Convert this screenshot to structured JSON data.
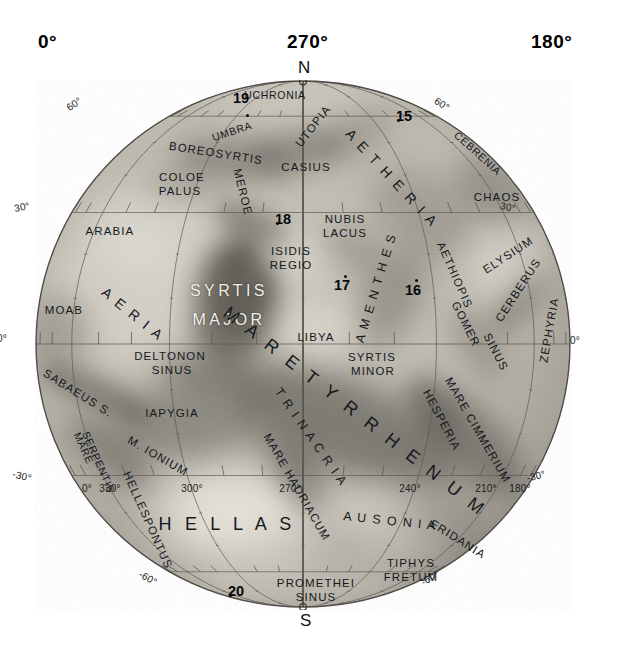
{
  "header_degrees": {
    "left": "0°",
    "middle": "270°",
    "right": "180°"
  },
  "poles": {
    "north": "N",
    "south": "S"
  },
  "globe": {
    "center_x": 303,
    "center_y": 344,
    "radius_x": 268,
    "radius_y": 264,
    "disk_color": "#b9b5ab",
    "limb_color": "#5d5a54"
  },
  "graticule": {
    "parallels": [
      60,
      30,
      0,
      -30,
      -60
    ],
    "meridian_step_deg": 30,
    "tick_step_deg": 10
  },
  "latitude_labels": [
    {
      "text": "60°",
      "x": 74,
      "y": 104,
      "rot": -34
    },
    {
      "text": "60°",
      "x": 442,
      "y": 104,
      "rot": 33
    },
    {
      "text": "30°",
      "x": 22,
      "y": 207,
      "rot": -12
    },
    {
      "text": "30°",
      "x": 508,
      "y": 207,
      "rot": 12
    },
    {
      "text": "0°",
      "x": 2,
      "y": 338,
      "rot": 0
    },
    {
      "text": "0°",
      "x": 575,
      "y": 340,
      "rot": 0
    },
    {
      "text": "-30°",
      "x": 22,
      "y": 476,
      "rot": 14
    },
    {
      "text": "-30°",
      "x": 536,
      "y": 476,
      "rot": -14
    },
    {
      "text": "-60°",
      "x": 148,
      "y": 578,
      "rot": 30
    },
    {
      "text": "-60°",
      "x": 430,
      "y": 578,
      "rot": -30
    }
  ],
  "longitude_labels": [
    {
      "text": "0°",
      "x": 87,
      "y": 488
    },
    {
      "text": "330°",
      "x": 110,
      "y": 488
    },
    {
      "text": "300°",
      "x": 192,
      "y": 488
    },
    {
      "text": "270°",
      "x": 290,
      "y": 488
    },
    {
      "text": "240°",
      "x": 410,
      "y": 488
    },
    {
      "text": "210°",
      "x": 486,
      "y": 488
    },
    {
      "text": "180°",
      "x": 520,
      "y": 488
    }
  ],
  "numbered_points": [
    {
      "label": "19",
      "x": 241,
      "y": 98,
      "dot_x": 247,
      "dot_y": 115,
      "dot_side": "below"
    },
    {
      "label": "15",
      "x": 404,
      "y": 116,
      "dot_x": 398,
      "dot_y": 120,
      "dot_side": "left"
    },
    {
      "label": "18",
      "x": 283,
      "y": 219,
      "dot_x": 277,
      "dot_y": 223,
      "dot_side": "left"
    },
    {
      "label": "17",
      "x": 342,
      "y": 285,
      "dot_x": 345,
      "dot_y": 276,
      "dot_side": "above"
    },
    {
      "label": "16",
      "x": 413,
      "y": 290,
      "dot_x": 416,
      "dot_y": 280,
      "dot_side": "above"
    },
    {
      "label": "20",
      "x": 236,
      "y": 591,
      "dot_x": 230,
      "dot_y": 595,
      "dot_side": "left"
    }
  ],
  "feature_labels": [
    {
      "text": "UCHRONIA",
      "x": 275,
      "y": 95,
      "rot": 0,
      "size": "s10",
      "align": "c"
    },
    {
      "text": "UMBRA",
      "x": 232,
      "y": 131,
      "rot": -18,
      "size": "s10",
      "align": "c"
    },
    {
      "text": "UTOPIA",
      "x": 313,
      "y": 126,
      "rot": -52,
      "size": "s11",
      "align": "c"
    },
    {
      "text": "BOREOSYRTIS",
      "x": 216,
      "y": 153,
      "rot": 9,
      "size": "s11",
      "align": "c"
    },
    {
      "text": "CASIUS",
      "x": 306,
      "y": 167,
      "rot": 0,
      "size": "s11",
      "align": "c"
    },
    {
      "text": "A E T H E R I A",
      "x": 392,
      "y": 178,
      "rot": 47,
      "size": "s14",
      "align": "c"
    },
    {
      "text": "CEBRENIA",
      "x": 478,
      "y": 153,
      "rot": 42,
      "size": "s10",
      "align": "c"
    },
    {
      "text": "COLOE",
      "x": 182,
      "y": 177,
      "rot": 0,
      "size": "s11",
      "align": "c"
    },
    {
      "text": "PALUS",
      "x": 180,
      "y": 191,
      "rot": 0,
      "size": "s11",
      "align": "c"
    },
    {
      "text": "MEROE",
      "x": 243,
      "y": 192,
      "rot": 76,
      "size": "s11",
      "align": "c"
    },
    {
      "text": "CHAOS",
      "x": 497,
      "y": 197,
      "rot": 0,
      "size": "s11",
      "align": "c"
    },
    {
      "text": "ARABIA",
      "x": 110,
      "y": 231,
      "rot": 0,
      "size": "s11",
      "align": "c"
    },
    {
      "text": "NUBIS",
      "x": 345,
      "y": 219,
      "rot": 0,
      "size": "s11",
      "align": "c"
    },
    {
      "text": "LACUS",
      "x": 345,
      "y": 233,
      "rot": 0,
      "size": "s11",
      "align": "c"
    },
    {
      "text": "ISIDIS",
      "x": 291,
      "y": 251,
      "rot": 0,
      "size": "s11",
      "align": "c"
    },
    {
      "text": "REGIO",
      "x": 291,
      "y": 265,
      "rot": 0,
      "size": "s11",
      "align": "c"
    },
    {
      "text": "ELYSIUM",
      "x": 508,
      "y": 255,
      "rot": -33,
      "size": "s11",
      "align": "c"
    },
    {
      "text": "AETHIOPIS",
      "x": 455,
      "y": 275,
      "rot": 66,
      "size": "s11",
      "align": "c"
    },
    {
      "text": "CERBERUS",
      "x": 518,
      "y": 290,
      "rot": -57,
      "size": "s11",
      "align": "c"
    },
    {
      "text": "ZEPHYRIA",
      "x": 549,
      "y": 330,
      "rot": -80,
      "size": "s11",
      "align": "c"
    },
    {
      "text": "MOAB",
      "x": 64,
      "y": 310,
      "rot": 0,
      "size": "s11",
      "align": "c"
    },
    {
      "text": "A E R I A",
      "x": 133,
      "y": 314,
      "rot": 39,
      "size": "s14",
      "align": "c"
    },
    {
      "text": "SYRTIS",
      "x": 229,
      "y": 291,
      "rot": 0,
      "size": "s16",
      "align": "c",
      "style": "white"
    },
    {
      "text": "MAJOR",
      "x": 229,
      "y": 320,
      "rot": 0,
      "size": "s16",
      "align": "c",
      "style": "white"
    },
    {
      "text": "LIBYA",
      "x": 316,
      "y": 337,
      "rot": 0,
      "size": "s11",
      "align": "c"
    },
    {
      "text": "GOMER",
      "x": 466,
      "y": 324,
      "rot": 63,
      "size": "s11",
      "align": "c"
    },
    {
      "text": "SINUS",
      "x": 496,
      "y": 352,
      "rot": 63,
      "size": "s11",
      "align": "c"
    },
    {
      "text": "DELTONON",
      "x": 170,
      "y": 356,
      "rot": 0,
      "size": "s11",
      "align": "c"
    },
    {
      "text": "SINUS",
      "x": 172,
      "y": 370,
      "rot": 0,
      "size": "s11",
      "align": "c"
    },
    {
      "text": "SYRTIS",
      "x": 372,
      "y": 357,
      "rot": 0,
      "size": "s11",
      "align": "c"
    },
    {
      "text": "MINOR",
      "x": 373,
      "y": 371,
      "rot": 0,
      "size": "s11",
      "align": "c"
    },
    {
      "text": "A M E N T H E S",
      "x": 376,
      "y": 288,
      "rot": -73,
      "size": "s12",
      "align": "c"
    },
    {
      "text": "SABAEUS S.",
      "x": 78,
      "y": 393,
      "rot": 32,
      "size": "s11",
      "align": "c"
    },
    {
      "text": "IAPYGIA",
      "x": 172,
      "y": 413,
      "rot": 0,
      "size": "s11",
      "align": "c"
    },
    {
      "text": "M A R E  T Y R R H E N U M",
      "x": 355,
      "y": 412,
      "rot": 38,
      "size": "s18",
      "align": "c"
    },
    {
      "text": "T R I N A C R I A",
      "x": 311,
      "y": 437,
      "rot": 55,
      "size": "s12",
      "align": "c"
    },
    {
      "text": "HESPERIA",
      "x": 442,
      "y": 420,
      "rot": 62,
      "size": "s11",
      "align": "c"
    },
    {
      "text": "MARE CIMMERIUM",
      "x": 478,
      "y": 430,
      "rot": 60,
      "size": "s11",
      "align": "c"
    },
    {
      "text": "MARE",
      "x": 84,
      "y": 448,
      "rot": 66,
      "size": "s10",
      "align": "c"
    },
    {
      "text": "SERPENTIS",
      "x": 99,
      "y": 462,
      "rot": 66,
      "size": "s10",
      "align": "c"
    },
    {
      "text": "M. IONIUM",
      "x": 158,
      "y": 456,
      "rot": 30,
      "size": "s11",
      "align": "c"
    },
    {
      "text": "MARE HADRIACUM",
      "x": 297,
      "y": 487,
      "rot": 60,
      "size": "s11",
      "align": "c"
    },
    {
      "text": "HELLESPONTUS",
      "x": 148,
      "y": 520,
      "rot": 66,
      "size": "s11",
      "align": "c"
    },
    {
      "text": "H E L L A S",
      "x": 227,
      "y": 524,
      "rot": 0,
      "size": "s18",
      "align": "c"
    },
    {
      "text": "A U S O N I A",
      "x": 390,
      "y": 521,
      "rot": 6,
      "size": "s12",
      "align": "c"
    },
    {
      "text": "ERIDANIA",
      "x": 458,
      "y": 539,
      "rot": 32,
      "size": "s11",
      "align": "c"
    },
    {
      "text": "TIPHYS",
      "x": 411,
      "y": 563,
      "rot": 0,
      "size": "s11",
      "align": "c"
    },
    {
      "text": "FRETUM",
      "x": 411,
      "y": 577,
      "rot": 0,
      "size": "s11",
      "align": "c"
    },
    {
      "text": "PROMETHEI",
      "x": 316,
      "y": 583,
      "rot": 0,
      "size": "s11",
      "align": "c"
    },
    {
      "text": "SINUS",
      "x": 316,
      "y": 597,
      "rot": 0,
      "size": "s11",
      "align": "c"
    }
  ],
  "albedo_features": [
    {
      "name": "syrtis-major",
      "cx": 235,
      "cy": 300,
      "rx": 46,
      "ry": 66,
      "rot": 10,
      "opacity": 0.62,
      "blur": 11
    },
    {
      "name": "syrtis-major-core",
      "cx": 238,
      "cy": 292,
      "rx": 30,
      "ry": 44,
      "rot": 12,
      "opacity": 0.5,
      "blur": 8
    },
    {
      "name": "syrtis-neck",
      "cx": 252,
      "cy": 225,
      "rx": 42,
      "ry": 17,
      "rot": 25,
      "opacity": 0.45,
      "blur": 10
    },
    {
      "name": "mare-tyrrhenum",
      "cx": 345,
      "cy": 425,
      "rx": 122,
      "ry": 45,
      "rot": 24,
      "opacity": 0.56,
      "blur": 16
    },
    {
      "name": "mare-cimmerium",
      "cx": 470,
      "cy": 440,
      "rx": 76,
      "ry": 30,
      "rot": 48,
      "opacity": 0.5,
      "blur": 14
    },
    {
      "name": "hesperia-dark",
      "cx": 432,
      "cy": 412,
      "rx": 40,
      "ry": 22,
      "rot": 55,
      "opacity": 0.35,
      "blur": 12
    },
    {
      "name": "iapygia-dark",
      "cx": 190,
      "cy": 420,
      "rx": 78,
      "ry": 40,
      "rot": -8,
      "opacity": 0.42,
      "blur": 16
    },
    {
      "name": "sabaeus-sinus",
      "cx": 95,
      "cy": 392,
      "rx": 60,
      "ry": 17,
      "rot": 26,
      "opacity": 0.48,
      "blur": 10
    },
    {
      "name": "mare-serpentis",
      "cx": 110,
      "cy": 452,
      "rx": 52,
      "ry": 22,
      "rot": 40,
      "opacity": 0.42,
      "blur": 12
    },
    {
      "name": "deltonon-sinus",
      "cx": 205,
      "cy": 372,
      "rx": 46,
      "ry": 20,
      "rot": 8,
      "opacity": 0.4,
      "blur": 12
    },
    {
      "name": "boreosyrtis",
      "cx": 236,
      "cy": 160,
      "rx": 62,
      "ry": 22,
      "rot": 5,
      "opacity": 0.38,
      "blur": 12
    },
    {
      "name": "casius-umbra",
      "cx": 296,
      "cy": 150,
      "rx": 48,
      "ry": 19,
      "rot": -8,
      "opacity": 0.34,
      "blur": 12
    },
    {
      "name": "utopia-dusky",
      "cx": 350,
      "cy": 135,
      "rx": 46,
      "ry": 22,
      "rot": -30,
      "opacity": 0.26,
      "blur": 14
    },
    {
      "name": "aetheria-dusky",
      "cx": 420,
      "cy": 215,
      "rx": 58,
      "ry": 36,
      "rot": 40,
      "opacity": 0.26,
      "blur": 16
    },
    {
      "name": "cebrenia-chaos",
      "cx": 489,
      "cy": 192,
      "rx": 42,
      "ry": 30,
      "rot": 40,
      "opacity": 0.3,
      "blur": 14
    },
    {
      "name": "amenthes-dark",
      "cx": 388,
      "cy": 300,
      "rx": 56,
      "ry": 30,
      "rot": -60,
      "opacity": 0.34,
      "blur": 14
    },
    {
      "name": "nubis-lacus",
      "cx": 352,
      "cy": 250,
      "rx": 36,
      "ry": 22,
      "rot": 20,
      "opacity": 0.24,
      "blur": 12
    },
    {
      "name": "cerberus-dark",
      "cx": 516,
      "cy": 305,
      "rx": 40,
      "ry": 15,
      "rot": -50,
      "opacity": 0.36,
      "blur": 11
    },
    {
      "name": "gomer-sinus",
      "cx": 478,
      "cy": 345,
      "rx": 42,
      "ry": 18,
      "rot": 62,
      "opacity": 0.28,
      "blur": 12
    },
    {
      "name": "hellas-bright",
      "cx": 236,
      "cy": 520,
      "rx": 86,
      "ry": 52,
      "rot": 0,
      "opacity": 0.55,
      "blur": 20,
      "bright": true
    },
    {
      "name": "hellas-core-bright",
      "cx": 228,
      "cy": 512,
      "rx": 54,
      "ry": 32,
      "rot": 0,
      "opacity": 0.5,
      "blur": 14,
      "bright": true
    },
    {
      "name": "aeria-bright",
      "cx": 125,
      "cy": 290,
      "rx": 72,
      "ry": 74,
      "rot": 0,
      "opacity": 0.42,
      "blur": 20,
      "bright": true
    },
    {
      "name": "arabia-bright",
      "cx": 150,
      "cy": 225,
      "rx": 64,
      "ry": 44,
      "rot": 0,
      "opacity": 0.36,
      "blur": 18,
      "bright": true
    },
    {
      "name": "libya-bright",
      "cx": 322,
      "cy": 330,
      "rx": 48,
      "ry": 30,
      "rot": 0,
      "opacity": 0.42,
      "blur": 16,
      "bright": true
    },
    {
      "name": "isidis-bright",
      "cx": 296,
      "cy": 256,
      "rx": 40,
      "ry": 28,
      "rot": 0,
      "opacity": 0.34,
      "blur": 14,
      "bright": true
    },
    {
      "name": "elysium-bright",
      "cx": 505,
      "cy": 258,
      "rx": 44,
      "ry": 34,
      "rot": -30,
      "opacity": 0.4,
      "blur": 16,
      "bright": true
    },
    {
      "name": "ausonia-bright",
      "cx": 392,
      "cy": 520,
      "rx": 62,
      "ry": 34,
      "rot": 8,
      "opacity": 0.32,
      "blur": 16,
      "bright": true
    },
    {
      "name": "eridania-dusky",
      "cx": 450,
      "cy": 525,
      "rx": 52,
      "ry": 30,
      "rot": 30,
      "opacity": 0.22,
      "blur": 16
    },
    {
      "name": "south-polar-haze",
      "cx": 300,
      "cy": 590,
      "rx": 110,
      "ry": 30,
      "rot": 0,
      "opacity": 0.3,
      "blur": 18,
      "bright": true
    },
    {
      "name": "north-polar-haze",
      "cx": 300,
      "cy": 95,
      "rx": 95,
      "ry": 22,
      "rot": 0,
      "opacity": 0.26,
      "blur": 16,
      "bright": true
    },
    {
      "name": "trinacria-dark",
      "cx": 290,
      "cy": 455,
      "rx": 44,
      "ry": 24,
      "rot": 40,
      "opacity": 0.3,
      "blur": 14
    },
    {
      "name": "mare-hadriacum",
      "cx": 300,
      "cy": 480,
      "rx": 40,
      "ry": 18,
      "rot": 60,
      "opacity": 0.34,
      "blur": 12
    },
    {
      "name": "coloe-palus",
      "cx": 180,
      "cy": 185,
      "rx": 34,
      "ry": 16,
      "rot": 0,
      "opacity": 0.22,
      "blur": 12
    },
    {
      "name": "moab-dusky",
      "cx": 62,
      "cy": 330,
      "rx": 30,
      "ry": 36,
      "rot": 0,
      "opacity": 0.26,
      "blur": 14
    }
  ]
}
